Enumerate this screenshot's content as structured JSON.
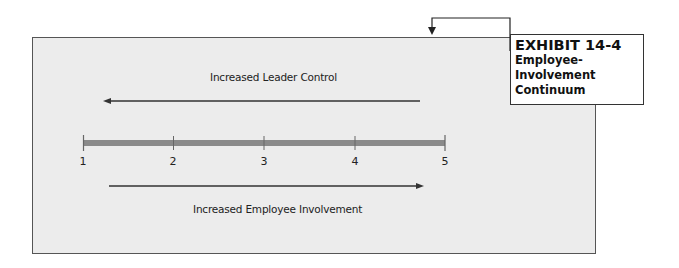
{
  "exhibit": {
    "title": "EXHIBIT 14-4",
    "subtitle_lines": [
      "Employee-",
      "Involvement",
      "Continuum"
    ]
  },
  "diagram": {
    "top_arrow_label": "Increased Leader Control",
    "bottom_arrow_label": "Increased Employee Involvement",
    "scale": {
      "ticks": [
        "1",
        "2",
        "3",
        "4",
        "5"
      ],
      "bar_color": "#8a8a8a"
    },
    "colors": {
      "panel_background": "#ececec",
      "arrow_color": "#333333",
      "border_color": "#555555"
    }
  }
}
